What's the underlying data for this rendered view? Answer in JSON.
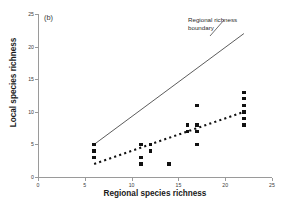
{
  "panel": {
    "label": "(b)"
  },
  "annotation": {
    "line1": "Regional richness",
    "line2": "boundary"
  },
  "chart_data": {
    "type": "scatter",
    "title": "",
    "xlabel": "Regional species richness",
    "ylabel": "Local species richness",
    "xlim": [
      0,
      25
    ],
    "ylim": [
      0,
      25
    ],
    "xticks": [
      0,
      5,
      10,
      15,
      20,
      25
    ],
    "yticks": [
      0,
      5,
      10,
      15,
      20,
      25
    ],
    "xtick_labels": [
      "0",
      "5",
      "10",
      "15",
      "20",
      "25"
    ],
    "ytick_labels": [
      "0",
      "5",
      "10",
      "15",
      "20",
      "25"
    ],
    "grid": false,
    "legend": false,
    "marker": "filled-square",
    "marker_color": "#111111",
    "points": [
      {
        "x": 6,
        "y": 5
      },
      {
        "x": 6,
        "y": 4
      },
      {
        "x": 6,
        "y": 3
      },
      {
        "x": 11,
        "y": 5
      },
      {
        "x": 11,
        "y": 3
      },
      {
        "x": 11,
        "y": 2
      },
      {
        "x": 12,
        "y": 5
      },
      {
        "x": 12,
        "y": 4
      },
      {
        "x": 14,
        "y": 2
      },
      {
        "x": 16,
        "y": 8
      },
      {
        "x": 16,
        "y": 7
      },
      {
        "x": 17,
        "y": 11
      },
      {
        "x": 17,
        "y": 8
      },
      {
        "x": 17,
        "y": 7
      },
      {
        "x": 17,
        "y": 5
      },
      {
        "x": 22,
        "y": 13
      },
      {
        "x": 22,
        "y": 12
      },
      {
        "x": 22,
        "y": 11
      },
      {
        "x": 22,
        "y": 10
      },
      {
        "x": 22,
        "y": 9
      },
      {
        "x": 22,
        "y": 8
      }
    ],
    "lines": [
      {
        "name": "Regional richness boundary",
        "style": "solid",
        "color": "#4a4a4a",
        "x0": 6,
        "y0": 5,
        "x1": 22,
        "y1": 22
      },
      {
        "name": "regression-fit",
        "style": "dotted",
        "color": "#111111",
        "x0": 6,
        "y0": 2,
        "x1": 22,
        "y1": 10
      }
    ]
  }
}
